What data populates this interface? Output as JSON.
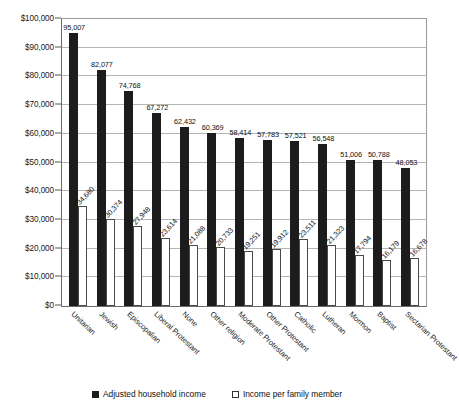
{
  "chart_data": {
    "type": "bar",
    "title": "",
    "subtitle": "",
    "xlabel": "",
    "ylabel": "",
    "ylim": [
      0,
      100000
    ],
    "ytick_labels": [
      "$100,000",
      "$90,000",
      "$80,000",
      "$70,000",
      "$60,000",
      "$50,000",
      "$40,000",
      "$30,000",
      "$20,000",
      "$10,000",
      "$0"
    ],
    "ytick_values": [
      100000,
      90000,
      80000,
      70000,
      60000,
      50000,
      40000,
      30000,
      20000,
      10000,
      0
    ],
    "grid": true,
    "legend_position": "bottom",
    "categories": [
      "Unitarian",
      "Jewish",
      "Episcopalian",
      "Liberal Protestant",
      "None",
      "Other religion",
      "Moderate Protestant",
      "Other Protestant",
      "Catholic",
      "Lutheran",
      "Mormon",
      "Baptist",
      "Sectarian Protestant"
    ],
    "series": [
      {
        "name": "Adjusted household income",
        "color": "#1c1c1c",
        "values": [
          95007,
          82077,
          74768,
          67272,
          62432,
          60369,
          58414,
          57783,
          57521,
          56548,
          51006,
          50788,
          48053
        ],
        "labels": [
          "95,007",
          "82,077",
          "74,768",
          "67,272",
          "62,432",
          "60,369",
          "58,414",
          "57,783",
          "57,521",
          "56,548",
          "51,006",
          "50,788",
          "48,053"
        ]
      },
      {
        "name": "Income per family member",
        "color": "#ffffff",
        "values": [
          34680,
          30374,
          27948,
          23614,
          21088,
          20733,
          19251,
          19912,
          23511,
          21323,
          17794,
          16179,
          16678
        ],
        "labels": [
          "34,680",
          "30,374",
          "27,948",
          "23,614",
          "21,088",
          "20,733",
          "19,251",
          "19,912",
          "23,511",
          "21,323",
          "17,794",
          "16,179",
          "16,678"
        ]
      }
    ]
  },
  "legend": {
    "items": [
      {
        "label": "Adjusted household income",
        "swatch": "dark-square-icon"
      },
      {
        "label": "Income per family member",
        "swatch": "light-square-icon"
      }
    ]
  }
}
